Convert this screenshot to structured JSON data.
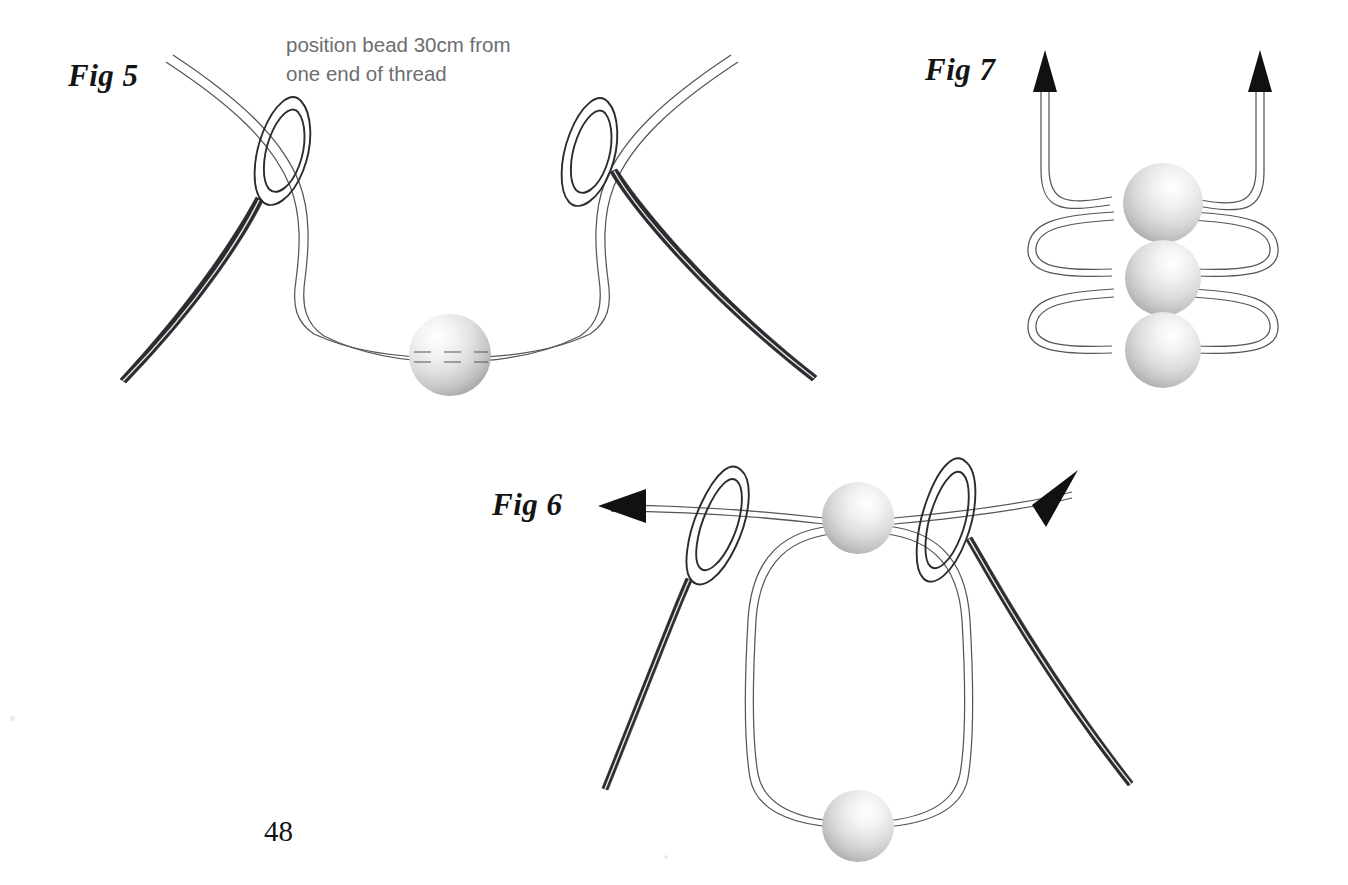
{
  "page": {
    "number": "48",
    "background_color": "#ffffff"
  },
  "figures": [
    {
      "id": "fig5",
      "label": "Fig 5",
      "caption": "position bead 30cm from\none end of thread",
      "description": "Two threaded needles with a single bead centred on a looping thread",
      "bead_count": 1,
      "needle_count": 2,
      "arrow_count": 0
    },
    {
      "id": "fig6",
      "label": "Fig 6",
      "caption": "",
      "description": "Two threaded needles pulling in opposite directions around a loop holding two beads",
      "bead_count": 2,
      "needle_count": 2,
      "arrow_count": 2
    },
    {
      "id": "fig7",
      "label": "Fig 7",
      "caption": "",
      "description": "Three stacked beads joined by looping threads with two upward arrows",
      "bead_count": 3,
      "needle_count": 0,
      "arrow_count": 2
    }
  ],
  "colors": {
    "thread_stroke": "#4b4b4f",
    "needle_stroke": "#2b2b30",
    "arrow_fill": "#111111",
    "bead_light": "#ffffff",
    "bead_mid": "#d9d9d9",
    "bead_dark": "#a9a9ad",
    "caption_text": "#6d6d70",
    "label_text": "#141414",
    "page_number_text": "#131313"
  }
}
